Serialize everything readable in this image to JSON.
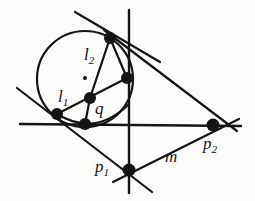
{
  "figure": {
    "kind": "geometry-diagram",
    "stroke_color": "#141414",
    "background_color": "#fbfbf9",
    "dot_color": "#141414",
    "canvas": {
      "width": 255,
      "height": 201
    }
  },
  "labels": [
    {
      "id": "l2",
      "base": "l",
      "sub": "2",
      "x": 84,
      "y": 46,
      "size": 17
    },
    {
      "id": "l1",
      "base": "l",
      "sub": "1",
      "x": 58,
      "y": 88,
      "size": 17
    },
    {
      "id": "q",
      "base": "q",
      "sub": "",
      "x": 95,
      "y": 100,
      "size": 17
    },
    {
      "id": "p1",
      "base": "p",
      "sub": "1",
      "x": 95,
      "y": 158,
      "size": 17
    },
    {
      "id": "p2",
      "base": "p",
      "sub": "2",
      "x": 203,
      "y": 135,
      "size": 17
    },
    {
      "id": "m",
      "base": "m",
      "sub": "",
      "x": 165,
      "y": 148,
      "size": 17
    }
  ],
  "points": [
    {
      "id": "circle-center",
      "x": 85,
      "y": 78,
      "r": 2.0
    },
    {
      "id": "top-vertex",
      "x": 110,
      "y": 38,
      "r": 6.0
    },
    {
      "id": "right-mid-vertex",
      "x": 127,
      "y": 78,
      "r": 6.0
    },
    {
      "id": "point-q",
      "x": 90,
      "y": 98,
      "r": 6.0
    },
    {
      "id": "left-vertex",
      "x": 57,
      "y": 114,
      "r": 6.0
    },
    {
      "id": "lower-left-node",
      "x": 85,
      "y": 124,
      "r": 6.0
    },
    {
      "id": "point-p1",
      "x": 129,
      "y": 170,
      "r": 6.5
    },
    {
      "id": "point-p2",
      "x": 213,
      "y": 125,
      "r": 6.5
    }
  ],
  "circle": {
    "id": "main-circle",
    "cx": 85,
    "cy": 79,
    "rx": 48,
    "ry": 48
  },
  "arc": {
    "id": "lower-arc",
    "path": "M 57 114 Q 95 136 127 106"
  },
  "lines": [
    {
      "id": "horizontal-line",
      "x1": 20,
      "y1": 124,
      "x2": 241,
      "y2": 126
    },
    {
      "id": "vertical-line",
      "x1": 129,
      "y1": 10,
      "x2": 129,
      "y2": 193
    },
    {
      "id": "line-l2-extended",
      "x1": 75,
      "y1": 12,
      "x2": 160,
      "y2": 62
    },
    {
      "id": "line-l1-extended",
      "x1": 17,
      "y1": 88,
      "x2": 152,
      "y2": 192
    },
    {
      "id": "line-top-to-p2",
      "x1": 104,
      "y1": 30,
      "x2": 237,
      "y2": 131
    },
    {
      "id": "line-p1-to-p2",
      "x1": 113,
      "y1": 182,
      "x2": 239,
      "y2": 119
    },
    {
      "id": "line-left-to-rightmid",
      "x1": 57,
      "y1": 114,
      "x2": 127,
      "y2": 78
    },
    {
      "id": "line-q-to-top",
      "x1": 90,
      "y1": 98,
      "x2": 110,
      "y2": 38
    },
    {
      "id": "line-q-to-lowerleft",
      "x1": 90,
      "y1": 98,
      "x2": 85,
      "y2": 124
    },
    {
      "id": "line-rightmid-to-top",
      "x1": 127,
      "y1": 78,
      "x2": 110,
      "y2": 38
    }
  ]
}
